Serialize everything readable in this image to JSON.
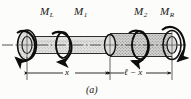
{
  "figure": {
    "caption": "(a)",
    "type": "engineering-shaft-torsion-diagram",
    "background_color": "#fcfcfa",
    "ink_color": "#161616"
  },
  "torques": [
    {
      "id": "ML",
      "base": "M",
      "subscript": "L",
      "position": "left-end",
      "sense": "clockwise"
    },
    {
      "id": "M1",
      "base": "M",
      "subscript": "1",
      "position": "inner-left",
      "sense": "clockwise"
    },
    {
      "id": "M2",
      "base": "M",
      "subscript": "2",
      "position": "inner-right",
      "sense": "clockwise"
    },
    {
      "id": "MR",
      "base": "M",
      "subscript": "R",
      "position": "right-end",
      "sense": "clockwise"
    }
  ],
  "dimensions": [
    {
      "id": "dim-x",
      "label": "x",
      "span": "left-end-to-middle-disc"
    },
    {
      "id": "dim-l-x",
      "label": "ℓ − x",
      "span": "middle-disc-to-right-end"
    }
  ],
  "shaft": {
    "fill": "stipple",
    "fill_color": "#dedede",
    "outline_color": "#1a1a1a",
    "centerline": "dash-dot"
  },
  "discs": [
    {
      "id": "disc-left",
      "label": "left end flange"
    },
    {
      "id": "disc-inner1",
      "label": "inner collar 1"
    },
    {
      "id": "disc-middle",
      "label": "middle section"
    },
    {
      "id": "disc-inner2",
      "label": "inner collar 2"
    },
    {
      "id": "disc-right",
      "label": "right end flange"
    }
  ]
}
